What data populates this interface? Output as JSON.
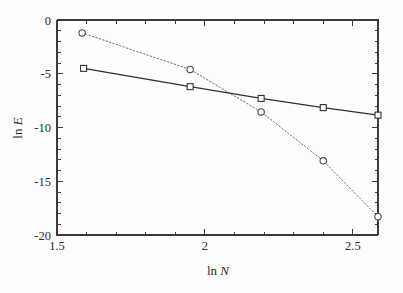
{
  "figure": {
    "background_color": "#fdfdfd",
    "frame_color": "#3a3a3a"
  },
  "chart_data": {
    "type": "line",
    "title": "",
    "subtitle": "",
    "xlabel": "ln N",
    "ylabel": "ln E",
    "xlabel_parts": {
      "prefix": "ln ",
      "italic": "N"
    },
    "ylabel_parts": {
      "prefix": "ln ",
      "italic": "E"
    },
    "xlim": [
      1.5,
      2.585
    ],
    "ylim": [
      -20,
      0
    ],
    "xticks": [
      1.5,
      2.0,
      2.5
    ],
    "xticklabels": [
      "1.5",
      "2",
      "2.5"
    ],
    "x_minor_step": 0.1,
    "yticks": [
      0,
      -5,
      -10,
      -15,
      -20
    ],
    "yticklabels": [
      "0",
      "-5",
      "-10",
      "-15",
      "-20"
    ],
    "y_minor_step": 1,
    "grid": false,
    "legend": null,
    "legend_position": "none",
    "annotations": [],
    "series": [
      {
        "name": "dotted-circles",
        "marker": "circle",
        "linestyle": "dotted",
        "color": "#6f6f6f",
        "x": [
          1.585,
          1.95,
          2.19,
          2.4,
          2.585
        ],
        "values": [
          -1.2,
          -4.6,
          -8.55,
          -13.1,
          -18.3
        ]
      },
      {
        "name": "solid-squares",
        "marker": "square",
        "linestyle": "solid",
        "color": "#303030",
        "x": [
          1.59,
          1.95,
          2.19,
          2.4,
          2.585
        ],
        "values": [
          -4.5,
          -6.2,
          -7.3,
          -8.15,
          -8.85
        ]
      }
    ]
  }
}
